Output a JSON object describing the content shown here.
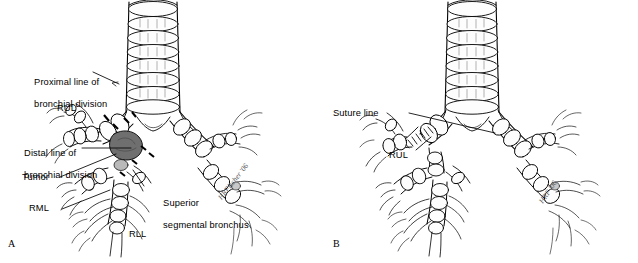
{
  "figure": {
    "type": "medical-illustration",
    "background_color": "#ffffff",
    "ink_color": "#000000",
    "tumor_fill": "#6a6a6a",
    "cartilage_shade": "#f2f2f2"
  },
  "panels": [
    {
      "id": "A",
      "letter": "A",
      "description": "Preoperative: tracheobronchial tree showing tumor at right upper lobe bronchus with proximal and distal lines of bronchial division",
      "signature": "HRFischer '06",
      "labels": [
        {
          "name": "proximal-line-of-bronchial-division",
          "line1": "Proximal line of",
          "line2": "bronchial division"
        },
        {
          "name": "rul",
          "line1": "RUL",
          "line2": ""
        },
        {
          "name": "distal-line-of-bronchial-division",
          "line1": "Distal line of",
          "line2": "bronchial division"
        },
        {
          "name": "tumor",
          "line1": "Tumor",
          "line2": ""
        },
        {
          "name": "rml",
          "line1": "RML",
          "line2": ""
        },
        {
          "name": "superior-segmental-bronchus",
          "line1": "Superior",
          "line2": "segmental bronchus"
        },
        {
          "name": "rll",
          "line1": "RLL",
          "line2": ""
        }
      ]
    },
    {
      "id": "B",
      "letter": "B",
      "description": "Postoperative: bronchial anastomosis completed, suture line joining bronchus to right upper lobe",
      "signature": "HRF '06",
      "labels": [
        {
          "name": "suture-line",
          "line1": "Suture line",
          "line2": ""
        },
        {
          "name": "rul",
          "line1": "RUL",
          "line2": ""
        }
      ]
    }
  ]
}
